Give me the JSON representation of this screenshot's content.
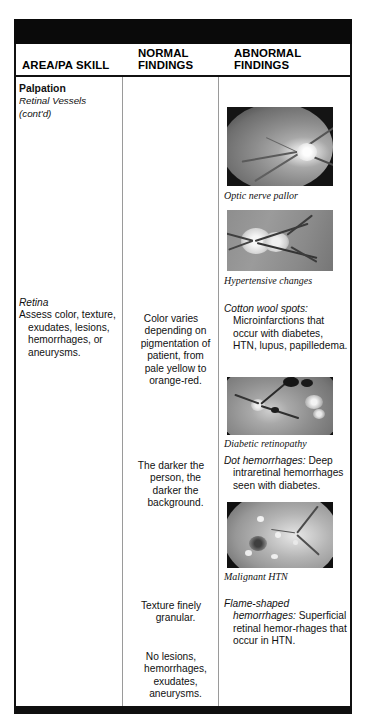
{
  "page": {
    "header_bar": "solid-black-rule",
    "footer_bar": "solid-black-rule"
  },
  "table": {
    "columns": [
      {
        "id": "area",
        "label_line1": "",
        "label_line2": "AREA/PA SKILL"
      },
      {
        "id": "normal",
        "label_line1": "NORMAL",
        "label_line2": "FINDINGS"
      },
      {
        "id": "abnormal",
        "label_line1": "ABNORMAL",
        "label_line2": "FINDINGS"
      }
    ]
  },
  "area_column": {
    "section_title": "Palpation",
    "subsection_continued": "Retinal Vessels (cont'd)",
    "retina_title": "Retina",
    "retina_body": "Assess color, texture, exudates, lesions, hemorrhages, or aneurysms."
  },
  "normal_findings": [
    {
      "text": "Color varies depending on pigmentation of patient, from pale yellow to orange-red."
    },
    {
      "text": "The darker the person, the darker the background."
    },
    {
      "text": "Texture finely granular."
    },
    {
      "text": "No lesions, hemorrhages, exudates, aneurysms."
    }
  ],
  "abnormal_findings": [
    {
      "lead": "Cotton wool spots:",
      "text": "Microinfarctions that occur with diabetes, HTN, lupus, papilledema."
    },
    {
      "lead": "Dot hemorrhages:",
      "text": "Deep intraretinal hemorrhages seen with diabetes."
    },
    {
      "lead": "Flame-shaped hemorrhages:",
      "text": "Superficial retinal hemor-rhages that occur in HTN."
    }
  ],
  "figures": [
    {
      "caption": "Optic nerve pallor",
      "alt": "fundus-photograph-optic-nerve-pallor"
    },
    {
      "caption": "Hypertensive changes",
      "alt": "fundus-photograph-hypertensive-changes"
    },
    {
      "caption": "Diabetic retinopathy",
      "alt": "fundus-photograph-diabetic-retinopathy"
    },
    {
      "caption": "Malignant HTN",
      "alt": "fundus-photograph-malignant-htn"
    }
  ]
}
